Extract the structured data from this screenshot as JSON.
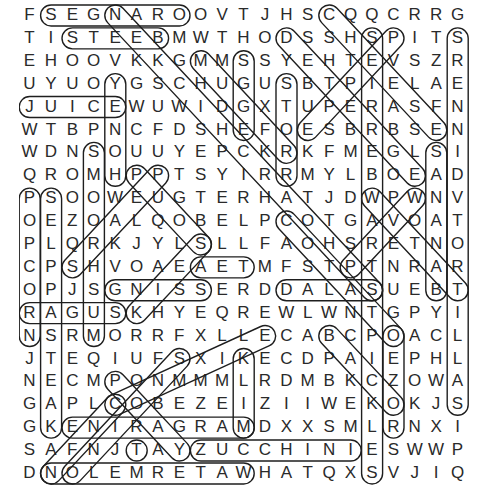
{
  "puzzle": {
    "type": "word-search",
    "grid": [
      "FSEGNAROOVTJHSCQQCRRG",
      "TISTEEBMWTHODSSHSPITS",
      "EHOOVKKGMMSSYEHTEVSZR",
      "UYUOYGSCHUGUSBTPIELAE",
      "JUICEWUWIDGXTUPERASFN",
      "WTBPNCFDSHEFOESBRBSEN",
      "WDNSOUUYEPCKRKFMEGLSI",
      "QROMHPPTSYIRRMYLBOEAD",
      "PSOOWEUGTERHATJDWPWNV",
      "OEZOALQOBELPCOTGAVOAT",
      "PLQRKJYLSLLFAOHSRETNO",
      "CPSHVOAEAETMFSTPTNRAR",
      "OPJSGNISSERDDALASUEBT",
      "RAGUSKHYEQREWLWNTGPYI",
      "NSRMORRFXLLECABCPOACL",
      "JTEQIUFSXIKECDPAIEPHL",
      "NECMPONMMMLRDMBKCZOWA",
      "GAPLCOBEZEIZIIWEKOKJS",
      "GKENIRAGRAMDXXSMLRNXI",
      "SAFNJTAYZUCCHINIESWWP",
      "DNOLEMRETAWHATQXSVJIQ"
    ],
    "rows": 21,
    "cols": 21,
    "found_words": [
      "ORANGES",
      "BEETS",
      "JUICE",
      "SUGAR",
      "ZUCCHINI",
      "WATERMELON",
      "MARGARINE",
      "DALLAS",
      "SERDD",
      "STAT"
    ],
    "colors": {
      "letter": "#2a2a2a",
      "outline": "#1e1e1e",
      "background": "#ffffff"
    },
    "highlights": [
      {
        "r1": 0,
        "c1": 1,
        "r2": 0,
        "c2": 7
      },
      {
        "r1": 1,
        "c1": 2,
        "r2": 1,
        "c2": 6
      },
      {
        "r1": 4,
        "c1": 0,
        "r2": 4,
        "c2": 4
      },
      {
        "r1": 19,
        "c1": 8,
        "r2": 19,
        "c2": 15
      },
      {
        "r1": 20,
        "c1": 1,
        "r2": 20,
        "c2": 10
      },
      {
        "r1": 18,
        "c1": 2,
        "r2": 18,
        "c2": 10
      },
      {
        "r1": 12,
        "c1": 4,
        "r2": 12,
        "c2": 8
      },
      {
        "r1": 12,
        "c1": 12,
        "r2": 12,
        "c2": 16
      },
      {
        "r1": 13,
        "c1": 0,
        "r2": 13,
        "c2": 4
      },
      {
        "r1": 11,
        "c1": 8,
        "r2": 11,
        "c2": 10
      },
      {
        "r1": 3,
        "c1": 4,
        "r2": 7,
        "c2": 4
      },
      {
        "r1": 8,
        "c1": 0,
        "r2": 14,
        "c2": 0
      },
      {
        "r1": 8,
        "c1": 1,
        "r2": 18,
        "c2": 1
      },
      {
        "r1": 6,
        "c1": 3,
        "r2": 14,
        "c2": 3
      },
      {
        "r1": 2,
        "c1": 10,
        "r2": 5,
        "c2": 10
      },
      {
        "r1": 3,
        "c1": 12,
        "r2": 7,
        "c2": 12
      },
      {
        "r1": 1,
        "c1": 16,
        "r2": 20,
        "c2": 16
      },
      {
        "r1": 1,
        "c1": 20,
        "r2": 17,
        "c2": 20
      },
      {
        "r1": 6,
        "c1": 19,
        "r2": 12,
        "c2": 19
      },
      {
        "r1": 14,
        "c1": 17,
        "r2": 18,
        "c2": 17
      },
      {
        "r1": 0,
        "c1": 14,
        "r2": 5,
        "c2": 19
      },
      {
        "r1": 1,
        "c1": 12,
        "r2": 7,
        "c2": 18
      },
      {
        "r1": 1,
        "c1": 17,
        "r2": 5,
        "c2": 13
      },
      {
        "r1": 0,
        "c1": 4,
        "r2": 12,
        "c2": 16
      },
      {
        "r1": 2,
        "c1": 8,
        "r2": 6,
        "c2": 12
      },
      {
        "r1": 8,
        "c1": 16,
        "r2": 12,
        "c2": 20
      },
      {
        "r1": 9,
        "c1": 12,
        "r2": 14,
        "c2": 17
      },
      {
        "r1": 14,
        "c1": 14,
        "r2": 17,
        "c2": 17
      },
      {
        "r1": 8,
        "c1": 18,
        "r2": 11,
        "c2": 15
      },
      {
        "r1": 7,
        "c1": 5,
        "r2": 10,
        "c2": 8
      },
      {
        "r1": 7,
        "c1": 6,
        "r2": 11,
        "c2": 2
      },
      {
        "r1": 10,
        "c1": 8,
        "r2": 13,
        "c2": 5
      },
      {
        "r1": 15,
        "c1": 7,
        "r2": 20,
        "c2": 2
      },
      {
        "r1": 14,
        "c1": 11,
        "r2": 17,
        "c2": 4
      },
      {
        "r1": 17,
        "c1": 4,
        "r2": 20,
        "c2": 1
      },
      {
        "r1": 16,
        "c1": 4,
        "r2": 19,
        "c2": 7
      },
      {
        "r1": 19,
        "c1": 5,
        "r2": 19,
        "c2": 5
      },
      {
        "r1": 15,
        "c1": 10,
        "r2": 18,
        "c2": 10
      }
    ]
  }
}
